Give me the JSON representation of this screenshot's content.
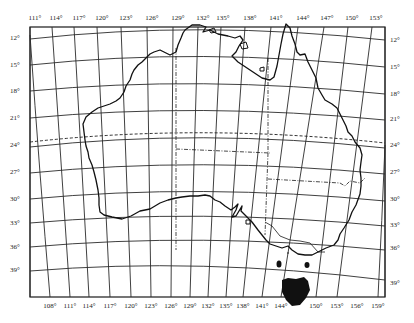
{
  "map": {
    "subject": "Australia",
    "projection_grid": "graticule at 3° intervals",
    "top_longitude_labels": [
      {
        "text": "111°",
        "x": 35
      },
      {
        "text": "114°",
        "x": 56
      },
      {
        "text": "117°",
        "x": 79
      },
      {
        "text": "120°",
        "x": 102
      },
      {
        "text": "123°",
        "x": 126
      },
      {
        "text": "126°",
        "x": 152
      },
      {
        "text": "129°",
        "x": 178
      },
      {
        "text": "132°",
        "x": 203
      },
      {
        "text": "135°",
        "x": 223
      },
      {
        "text": "138°",
        "x": 250
      },
      {
        "text": "141°",
        "x": 276
      },
      {
        "text": "144°",
        "x": 303
      },
      {
        "text": "147°",
        "x": 327
      },
      {
        "text": "150°",
        "x": 352
      },
      {
        "text": "153°",
        "x": 376
      }
    ],
    "bottom_longitude_labels": [
      {
        "text": "108°",
        "x": 50
      },
      {
        "text": "111°",
        "x": 70
      },
      {
        "text": "114°",
        "x": 89
      },
      {
        "text": "117°",
        "x": 110
      },
      {
        "text": "120°",
        "x": 131
      },
      {
        "text": "123°",
        "x": 151
      },
      {
        "text": "126°",
        "x": 171
      },
      {
        "text": "129°",
        "x": 190
      },
      {
        "text": "132°",
        "x": 208
      },
      {
        "text": "135°",
        "x": 226
      },
      {
        "text": "138°",
        "x": 243
      },
      {
        "text": "141°",
        "x": 262
      },
      {
        "text": "144°",
        "x": 281
      },
      {
        "text": "150°",
        "x": 316
      },
      {
        "text": "153°",
        "x": 337
      },
      {
        "text": "156°",
        "x": 357
      },
      {
        "text": "159°",
        "x": 378
      }
    ],
    "left_latitude_labels": [
      {
        "text": "12°",
        "y": 38
      },
      {
        "text": "15°",
        "y": 65
      },
      {
        "text": "18°",
        "y": 91
      },
      {
        "text": "21°",
        "y": 118
      },
      {
        "text": "24°",
        "y": 145
      },
      {
        "text": "27°",
        "y": 172
      },
      {
        "text": "30°",
        "y": 199
      },
      {
        "text": "33°",
        "y": 223
      },
      {
        "text": "36°",
        "y": 247
      },
      {
        "text": "39°",
        "y": 270
      }
    ],
    "right_latitude_labels": [
      {
        "text": "12°",
        "y": 40
      },
      {
        "text": "15°",
        "y": 67
      },
      {
        "text": "18°",
        "y": 94
      },
      {
        "text": "21°",
        "y": 119
      },
      {
        "text": "24°",
        "y": 145
      },
      {
        "text": "27°",
        "y": 172
      },
      {
        "text": "30°",
        "y": 199
      },
      {
        "text": "33°",
        "y": 225
      },
      {
        "text": "36°",
        "y": 248
      },
      {
        "text": "39°",
        "y": 283
      }
    ],
    "colors": {
      "ink": "#1a1a1a",
      "background": "#ffffff",
      "grid": "#2a2a2a",
      "tasmania_fill": "#111111"
    }
  }
}
